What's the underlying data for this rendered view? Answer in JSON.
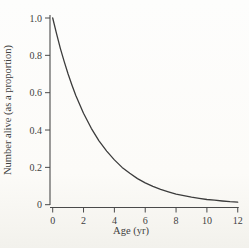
{
  "figure": {
    "background": "#fcfbf8"
  },
  "chart_data": {
    "type": "line",
    "title": "",
    "xlabel": "Age (yr)",
    "ylabel": "Number alive (as a proportion)",
    "xlim": [
      0,
      12
    ],
    "ylim": [
      0,
      1.0
    ],
    "xticks": [
      0,
      2,
      4,
      6,
      8,
      10,
      12
    ],
    "xtick_labels": [
      "0",
      "2",
      "4",
      "6",
      "8",
      "10",
      "12"
    ],
    "yticks": [
      0,
      0.2,
      0.4,
      0.6,
      0.8,
      1.0
    ],
    "ytick_labels": [
      "0",
      "0.2",
      "0.4",
      "0.6",
      "0.8",
      "1.0"
    ],
    "grid": false,
    "legend": null,
    "line_color": "#3c3c3c",
    "axis_color": "#4a4a4a",
    "series": [
      {
        "name": "proportion-alive",
        "x": [
          0,
          0.25,
          0.5,
          0.75,
          1,
          1.25,
          1.5,
          2,
          2.5,
          3,
          3.5,
          4,
          4.5,
          5,
          5.5,
          6,
          6.5,
          7,
          7.5,
          8,
          8.5,
          9,
          9.5,
          10,
          10.5,
          11,
          11.5,
          12
        ],
        "y": [
          1.0,
          0.915,
          0.836,
          0.765,
          0.7,
          0.64,
          0.585,
          0.49,
          0.409,
          0.342,
          0.287,
          0.24,
          0.2,
          0.168,
          0.14,
          0.117,
          0.098,
          0.082,
          0.069,
          0.057,
          0.048,
          0.04,
          0.034,
          0.028,
          0.024,
          0.02,
          0.016,
          0.014
        ]
      }
    ]
  }
}
